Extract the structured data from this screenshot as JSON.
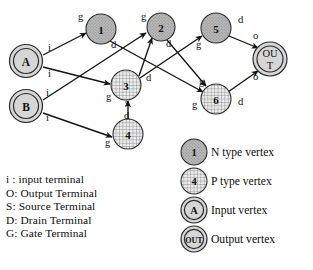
{
  "diagram": {
    "vertices": [
      {
        "id": "A",
        "label": "A",
        "type": "input",
        "x": 26,
        "y": 61,
        "r": 17
      },
      {
        "id": "B",
        "label": "B",
        "type": "input",
        "x": 26,
        "y": 106,
        "r": 17
      },
      {
        "id": "1",
        "label": "1",
        "type": "n",
        "x": 101,
        "y": 29,
        "r": 15
      },
      {
        "id": "2",
        "label": "2",
        "type": "n",
        "x": 161,
        "y": 27,
        "r": 14
      },
      {
        "id": "5",
        "label": "5",
        "type": "n",
        "x": 216,
        "y": 28,
        "r": 15
      },
      {
        "id": "3",
        "label": "3",
        "type": "p",
        "x": 126,
        "y": 85,
        "r": 15
      },
      {
        "id": "6",
        "label": "6",
        "type": "p",
        "x": 216,
        "y": 99,
        "r": 15
      },
      {
        "id": "4",
        "label": "4",
        "type": "p",
        "x": 128,
        "y": 134,
        "r": 15
      },
      {
        "id": "OUT",
        "label": "OUT",
        "type": "output",
        "x": 270,
        "y": 59,
        "r": 17
      }
    ],
    "edges": [
      {
        "from": "A",
        "to": "1",
        "tail_label": "i",
        "head_label": "g"
      },
      {
        "from": "A",
        "to": "3",
        "tail_label": "i",
        "head_label": "g"
      },
      {
        "from": "B",
        "to": "2",
        "tail_label": "i",
        "head_label": "g"
      },
      {
        "from": "B",
        "to": "4",
        "tail_label": "i",
        "head_label": "g"
      },
      {
        "from": "1",
        "to": "6",
        "tail_label": "d",
        "head_label": "g"
      },
      {
        "from": "3",
        "to": "2",
        "tail_label": "d",
        "head_label": "g"
      },
      {
        "from": "2",
        "to": "6",
        "tail_label": "d",
        "head_label": "g"
      },
      {
        "from": "3",
        "to": "5",
        "tail_label": "d",
        "head_label": "g"
      },
      {
        "from": "4",
        "to": "3",
        "tail_label": "d",
        "head_label": "s"
      },
      {
        "from": "5",
        "to": "OUT",
        "tail_label": "d",
        "head_label": "o"
      },
      {
        "from": "6",
        "to": "OUT",
        "tail_label": "d",
        "head_label": "o"
      }
    ],
    "edge_labels": [
      {
        "text": "i",
        "x": 48,
        "y": 51
      },
      {
        "text": "i",
        "x": 48,
        "y": 77
      },
      {
        "text": "i",
        "x": 46,
        "y": 96
      },
      {
        "text": "i",
        "x": 46,
        "y": 121
      },
      {
        "text": "g",
        "x": 78,
        "y": 20
      },
      {
        "text": "d",
        "x": 111,
        "y": 48
      },
      {
        "text": "g",
        "x": 141,
        "y": 20
      },
      {
        "text": "d",
        "x": 166,
        "y": 47
      },
      {
        "text": "g",
        "x": 106,
        "y": 100
      },
      {
        "text": "d",
        "x": 146,
        "y": 81
      },
      {
        "text": "s",
        "x": 125,
        "y": 106
      },
      {
        "text": "d",
        "x": 124,
        "y": 119
      },
      {
        "text": "g",
        "x": 105,
        "y": 146
      },
      {
        "text": "g",
        "x": 196,
        "y": 48
      },
      {
        "text": "d",
        "x": 238,
        "y": 23
      },
      {
        "text": "o",
        "x": 253,
        "y": 39
      },
      {
        "text": "g",
        "x": 199,
        "y": 85
      },
      {
        "text": "g",
        "x": 192,
        "y": 108
      },
      {
        "text": "d",
        "x": 238,
        "y": 105
      },
      {
        "text": "o",
        "x": 253,
        "y": 80
      }
    ]
  },
  "legend_terms": [
    "i : input terminal",
    "O: Output Terminal",
    "S: Source Terminal",
    "D: Drain Terminal",
    "G: Gate Terminal"
  ],
  "legend_keys": [
    {
      "icon": "n-type-vertex-icon",
      "sample": "1",
      "label": "N type vertex"
    },
    {
      "icon": "p-type-vertex-icon",
      "sample": "4",
      "label": "P type vertex"
    },
    {
      "icon": "input-vertex-icon",
      "sample": "A",
      "label": "Input vertex"
    },
    {
      "icon": "output-vertex-icon",
      "sample": "OUT",
      "label": "Output vertex"
    }
  ],
  "colors": {
    "stroke": "#141414",
    "n_fill": "#b5b5b5",
    "p_fill": "#d8d8d8",
    "background": "#ffffff"
  }
}
